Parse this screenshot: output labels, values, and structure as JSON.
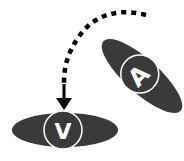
{
  "diagram": {
    "colors": {
      "shape_fill": "#3a3a3a",
      "ring_stroke": "#ffffff",
      "arrow": "#000000",
      "background": "#ffffff"
    },
    "nodes": [
      {
        "id": "A",
        "label": "A",
        "shape": "ellipse",
        "orientation": "tilted"
      },
      {
        "id": "V",
        "label": "V",
        "shape": "ellipse",
        "orientation": "horizontal"
      }
    ],
    "edges": [
      {
        "from": "A",
        "to": "V",
        "style": "dashed-curve",
        "arrowhead": "down-arrow"
      }
    ]
  }
}
